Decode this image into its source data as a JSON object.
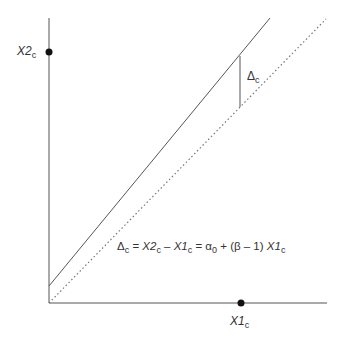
{
  "diagram": {
    "axes": {
      "y_label_main": "X2",
      "y_label_sub": "c",
      "x_label_main": "X1",
      "x_label_sub": "c"
    },
    "delta_label": {
      "main": "Δ",
      "sub": "c"
    },
    "equation": {
      "delta": "Δ",
      "delta_sub": "c",
      "eq1": " = ",
      "x2": "X2",
      "x2_sub": "c",
      "minus": " – ",
      "x1": "X1",
      "x1_sub": "c",
      "eq2": " = α",
      "alpha_sub": "0",
      "rest": " + (β – 1) ",
      "x1b": "X1",
      "x1b_sub": "c"
    },
    "lines": [
      {
        "name": "regression-line",
        "style": "solid"
      },
      {
        "name": "identity-line",
        "style": "dotted"
      }
    ],
    "colors": {
      "line": "#555555",
      "dot": "#111111"
    }
  }
}
